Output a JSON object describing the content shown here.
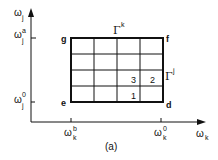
{
  "diagram": {
    "caption": "(a)",
    "axes": {
      "y": {
        "symbol": "ω",
        "sub": "j",
        "sup": ""
      },
      "x": {
        "symbol": "ω",
        "sub": "k",
        "sup": ""
      }
    },
    "ticks": {
      "y_top": {
        "symbol": "ω",
        "sub": "j",
        "sup": "a"
      },
      "y_bottom": {
        "symbol": "ω",
        "sub": "j",
        "sup": "0"
      },
      "x_left": {
        "symbol": "ω",
        "sub": "k",
        "sup": "b"
      },
      "x_right": {
        "symbol": "ω",
        "sub": "k",
        "sup": "0"
      }
    },
    "corners": {
      "g": "g",
      "f": "f",
      "e": "e",
      "d": "d"
    },
    "boundaries": {
      "top": {
        "symbol": "Γ",
        "sup": "k"
      },
      "right": {
        "symbol": "Γ",
        "sup": "j"
      }
    },
    "grid": {
      "columns": 4,
      "rows": 4
    },
    "cell_labels": [
      {
        "text": "1",
        "col": 3,
        "row": 4
      },
      {
        "text": "3",
        "col": 3,
        "row": 3
      },
      {
        "text": "2",
        "col": 4,
        "row": 3
      }
    ],
    "colors": {
      "line": "#111111",
      "background": "#ffffff"
    }
  }
}
